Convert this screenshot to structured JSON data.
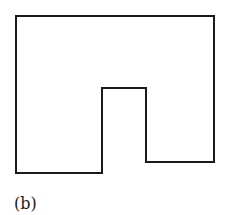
{
  "figure": {
    "label": "(b)",
    "shape": {
      "description": "Rectilinear outline: rectangle with a notch cut up from the bottom, right bottom segment higher than left",
      "stroke_color": "#1a1a1a",
      "points": [
        [
          16,
          16
        ],
        [
          214,
          16
        ],
        [
          214,
          162
        ],
        [
          146,
          162
        ],
        [
          146,
          88
        ],
        [
          102,
          88
        ],
        [
          102,
          173
        ],
        [
          16,
          173
        ]
      ]
    }
  }
}
